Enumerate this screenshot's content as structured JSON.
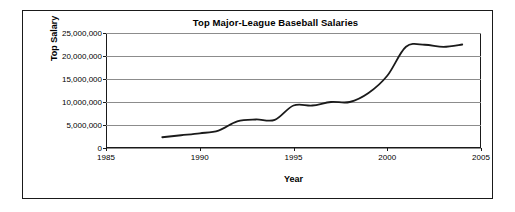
{
  "chart_data": {
    "type": "line",
    "title": "Top Major-League Baseball Salaries",
    "xlabel": "Year",
    "ylabel": "Top Salary",
    "xlim": [
      1985,
      2005
    ],
    "ylim": [
      0,
      25000000
    ],
    "grid": true,
    "legend": false,
    "xticks": [
      1985,
      1990,
      1995,
      2000,
      2005
    ],
    "xtick_labels": [
      "1985",
      "1990",
      "1995",
      "2000",
      "2005"
    ],
    "yticks": [
      0,
      5000000,
      10000000,
      15000000,
      20000000,
      25000000
    ],
    "ytick_labels": [
      "0",
      "5,000,000",
      "10,000,000",
      "15,000,000",
      "20,000,000",
      "25,000,000"
    ],
    "line_color": "#1a1a1a",
    "grid_color": "#8c8c8c",
    "series": [
      {
        "name": "Top Salary",
        "x": [
          1988,
          1989,
          1990,
          1991,
          1992,
          1993,
          1994,
          1995,
          1996,
          1997,
          1998,
          1999,
          2000,
          2001,
          2002,
          2003,
          2004
        ],
        "values": [
          2340000,
          2770000,
          3200000,
          3800000,
          5800000,
          6200000,
          6100000,
          9240000,
          9240000,
          10000000,
          10000000,
          11950000,
          15700000,
          22000000,
          22450000,
          22000000,
          22500000
        ]
      }
    ]
  }
}
